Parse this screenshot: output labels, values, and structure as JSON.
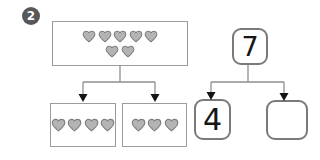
{
  "problem": {
    "number": "2"
  },
  "whole_box": {
    "total_hearts": 7,
    "heart_rows": [
      5,
      2
    ]
  },
  "part_boxes": [
    {
      "hearts": 4
    },
    {
      "hearts": 3
    }
  ],
  "number_bond": {
    "whole": "7",
    "part_filled": "4",
    "part_missing": ""
  },
  "colors": {
    "heart_fill": "#b4b4b4",
    "heart_stroke": "#7d7d7d",
    "box_border": "#9c9c9c",
    "bond_border": "#7a7a7a",
    "connector": "#8f8f8f",
    "arrowhead": "#141414",
    "badge_bg": "#58585a",
    "badge_text": "#ffffff"
  }
}
